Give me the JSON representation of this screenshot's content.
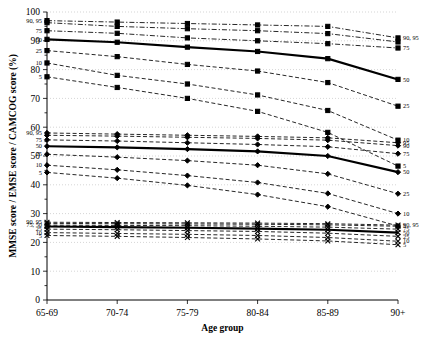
{
  "chart_data": {
    "type": "line",
    "title": "",
    "xlabel": "Age group",
    "ylabel": "MMSE score / EMSE score / CAMCOG score (%)",
    "categories": [
      "65-69",
      "70-74",
      "75-79",
      "80-84",
      "85-89",
      "90+"
    ],
    "ylim": [
      0,
      100
    ],
    "yticks": [
      0,
      10,
      20,
      30,
      40,
      50,
      60,
      70,
      80,
      90,
      100
    ],
    "grid": true,
    "legend_position": "inline-endpoints",
    "groups": [
      {
        "name": "MMSE",
        "marker": "square",
        "series": [
          {
            "name": "95",
            "percentile": 95,
            "label_left": "90, 95",
            "label_right": "90, 95",
            "style": "dashdot",
            "values": [
              97.0,
              96.5,
              96.0,
              95.5,
              95.0,
              91.0
            ]
          },
          {
            "name": "90",
            "percentile": 90,
            "label_left": "",
            "label_right": "",
            "style": "dashdot",
            "values": [
              96.3,
              95.0,
              94.2,
              93.5,
              92.5,
              89.6
            ]
          },
          {
            "name": "75",
            "percentile": 75,
            "label_left": "75",
            "label_right": "75",
            "style": "dashdot",
            "values": [
              93.5,
              92.6,
              91.0,
              90.0,
              89.0,
              87.5
            ]
          },
          {
            "name": "50",
            "percentile": 50,
            "label_left": "50",
            "label_right": "50",
            "style": "solid-bold",
            "values": [
              90.5,
              89.5,
              87.8,
              86.3,
              83.8,
              76.6
            ]
          },
          {
            "name": "25",
            "percentile": 25,
            "label_left": "25",
            "label_right": "25",
            "style": "dashed",
            "values": [
              86.6,
              84.5,
              81.8,
              79.5,
              75.5,
              67.3
            ]
          },
          {
            "name": "10",
            "percentile": 10,
            "label_left": "10",
            "label_right": "10",
            "style": "dashed",
            "values": [
              82.3,
              78.0,
              75.0,
              71.2,
              65.8,
              55.5
            ]
          },
          {
            "name": "5",
            "percentile": 5,
            "label_left": "5",
            "label_right": "5",
            "style": "dashed",
            "values": [
              77.5,
              73.8,
              70.0,
              65.5,
              58.2,
              46.5
            ]
          }
        ]
      },
      {
        "name": "EMSE",
        "marker": "diamond",
        "series": [
          {
            "name": "95",
            "percentile": 95,
            "label_left": "90, 95",
            "label_right": "95",
            "style": "dashed",
            "values": [
              58.0,
              57.6,
              57.2,
              56.8,
              56.3,
              54.6
            ]
          },
          {
            "name": "90",
            "percentile": 90,
            "label_left": "",
            "label_right": "90",
            "style": "dashed",
            "values": [
              57.2,
              56.9,
              56.5,
              56.1,
              55.5,
              53.6
            ]
          },
          {
            "name": "75",
            "percentile": 75,
            "label_left": "75",
            "label_right": "75",
            "style": "dashed",
            "values": [
              55.6,
              55.2,
              54.6,
              54.0,
              53.2,
              50.8
            ]
          },
          {
            "name": "50",
            "percentile": 50,
            "label_left": "50",
            "label_right": "50",
            "style": "solid-bold",
            "values": [
              53.4,
              53.0,
              52.4,
              51.6,
              50.0,
              44.4
            ]
          },
          {
            "name": "25",
            "percentile": 25,
            "label_left": "25",
            "label_right": "25",
            "style": "dashed",
            "values": [
              50.6,
              49.6,
              48.4,
              46.8,
              43.8,
              36.9
            ]
          },
          {
            "name": "10",
            "percentile": 10,
            "label_left": "10",
            "label_right": "10",
            "style": "dashed",
            "values": [
              46.8,
              45.2,
              43.2,
              40.8,
              37.0,
              30.0
            ]
          },
          {
            "name": "5",
            "percentile": 5,
            "label_left": "5",
            "label_right": "5",
            "style": "dashed",
            "values": [
              44.3,
              42.3,
              39.8,
              36.6,
              32.4,
              25.7
            ]
          }
        ]
      },
      {
        "name": "CAMCOG",
        "marker": "x",
        "series": [
          {
            "name": "95",
            "percentile": 95,
            "label_left": "90, 95",
            "label_right": "90, 95",
            "style": "dashed",
            "values": [
              27.0,
              26.9,
              26.8,
              26.7,
              26.5,
              26.0
            ]
          },
          {
            "name": "90",
            "percentile": 90,
            "label_left": "",
            "label_right": "",
            "style": "dashed",
            "values": [
              26.6,
              26.5,
              26.4,
              26.3,
              26.1,
              25.6
            ]
          },
          {
            "name": "75",
            "percentile": 75,
            "label_left": "75, 50",
            "label_right": "75",
            "style": "dashed",
            "values": [
              26.0,
              25.9,
              25.8,
              25.6,
              25.3,
              24.6
            ]
          },
          {
            "name": "50",
            "percentile": 50,
            "label_left": "",
            "label_right": "50",
            "style": "solid-bold",
            "values": [
              25.5,
              25.3,
              25.1,
              24.8,
              24.4,
              23.4
            ]
          },
          {
            "name": "25",
            "percentile": 25,
            "label_left": "25",
            "label_right": "25",
            "style": "dashed",
            "values": [
              24.6,
              24.4,
              24.1,
              23.8,
              23.2,
              22.1
            ]
          },
          {
            "name": "10",
            "percentile": 10,
            "label_left": "10",
            "label_right": "10",
            "style": "dashed",
            "values": [
              23.4,
              23.1,
              22.8,
              22.4,
              21.7,
              20.4
            ]
          },
          {
            "name": "5",
            "percentile": 5,
            "label_left": "5",
            "label_right": "5",
            "style": "dashed",
            "values": [
              22.4,
              22.1,
              21.7,
              21.2,
              20.5,
              19.2
            ]
          }
        ]
      }
    ]
  }
}
